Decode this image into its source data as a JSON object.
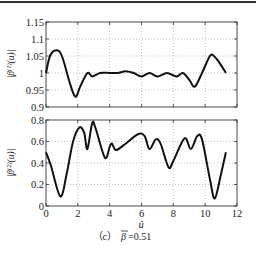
{
  "figure": {
    "caption_prefix": "（c）",
    "caption_symbol": "β",
    "caption_value": "=0.51",
    "xlabel": "û"
  },
  "chart_data": [
    {
      "type": "line",
      "ylabel": "|β^(1)(u)|",
      "ylabel_main": "|β",
      "ylabel_sup": "(1)",
      "ylabel_tail": "(u)|",
      "xlabel": "",
      "xlim": [
        0,
        12
      ],
      "ylim": [
        0.9,
        1.15
      ],
      "yticks": [
        "0.9",
        "0.95",
        "1",
        "1.05",
        "1.1",
        "1.15"
      ],
      "grid": true,
      "x": [
        0,
        0.25,
        0.65,
        1.0,
        1.5,
        1.85,
        2.15,
        2.6,
        2.9,
        3.4,
        4.0,
        4.5,
        5.0,
        5.5,
        6.0,
        6.5,
        7.0,
        7.6,
        8.2,
        8.6,
        9.0,
        9.35,
        9.8,
        10.3,
        10.55,
        10.9,
        11.3
      ],
      "values": [
        1.0,
        1.05,
        1.067,
        1.05,
        0.97,
        0.93,
        0.96,
        1.0,
        0.99,
        1.0,
        1.0,
        1.0,
        1.005,
        1.0,
        0.99,
        1.0,
        0.99,
        1.0,
        0.99,
        1.0,
        0.98,
        0.96,
        1.0,
        1.05,
        1.05,
        1.03,
        1.0
      ]
    },
    {
      "type": "line",
      "ylabel": "|β^(2)(u)|",
      "ylabel_main": "|β",
      "ylabel_sup": "(2)",
      "ylabel_tail": "(u)|",
      "xlabel": "û",
      "xlim": [
        0,
        12
      ],
      "ylim": [
        0,
        0.8
      ],
      "xticks": [
        "0",
        "2",
        "4",
        "6",
        "8",
        "10",
        "12"
      ],
      "yticks": [
        "0",
        "0.2",
        "0.4",
        "0.6",
        "0.8"
      ],
      "grid": true,
      "x": [
        0,
        0.3,
        0.9,
        1.3,
        1.7,
        2.1,
        2.4,
        2.6,
        2.9,
        3.1,
        3.7,
        4.0,
        4.15,
        4.4,
        5.0,
        5.8,
        6.2,
        6.5,
        6.9,
        7.2,
        7.7,
        8.0,
        8.7,
        9.1,
        9.5,
        9.8,
        10.3,
        10.6,
        11.0,
        11.3
      ],
      "values": [
        0.5,
        0.38,
        0.09,
        0.3,
        0.6,
        0.73,
        0.68,
        0.53,
        0.77,
        0.73,
        0.45,
        0.55,
        0.58,
        0.52,
        0.58,
        0.67,
        0.65,
        0.53,
        0.62,
        0.58,
        0.36,
        0.42,
        0.63,
        0.53,
        0.65,
        0.62,
        0.25,
        0.07,
        0.3,
        0.5
      ]
    }
  ]
}
